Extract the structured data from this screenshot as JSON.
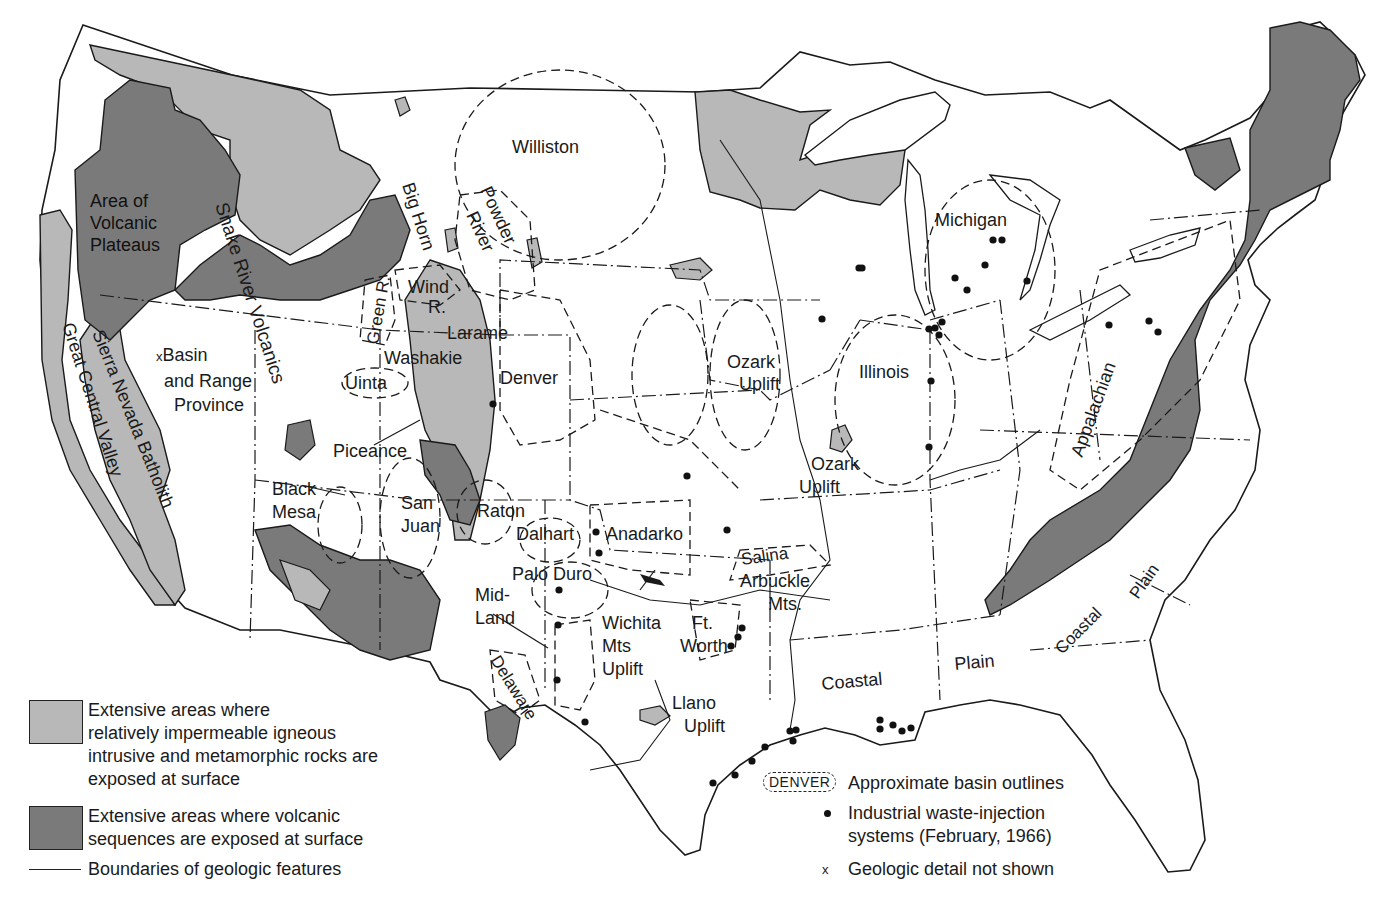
{
  "map": {
    "title": "Geologic basins and industrial waste-injection systems of the conterminous United States",
    "colors": {
      "igneous_metamorphic": "#b8b8b8",
      "volcanic": "#7a7a7a",
      "land": "#ffffff",
      "line": "#1a1a1a"
    },
    "region_labels": [
      {
        "id": "volcanic-plateaus",
        "lines": [
          "Area of",
          "Volcanic",
          "Plateaus"
        ]
      },
      {
        "id": "snake-river",
        "text": "Snake River Volcanics"
      },
      {
        "id": "basin-range",
        "marker": "x",
        "lines": [
          "Basin",
          "and Range",
          "Province"
        ]
      },
      {
        "id": "great-central-valley",
        "text": "Great Central Valley"
      },
      {
        "id": "sierra-nevada",
        "text": "Sierra Nevada Batholith"
      },
      {
        "id": "williston",
        "text": "Williston"
      },
      {
        "id": "big-horn",
        "text": "Big Horn"
      },
      {
        "id": "powder-river",
        "lines": [
          "Powder",
          "River"
        ]
      },
      {
        "id": "wind-river",
        "lines": [
          "Wind",
          "R."
        ]
      },
      {
        "id": "green-river",
        "text": "Green R."
      },
      {
        "id": "laramie",
        "text": "Larame"
      },
      {
        "id": "washakie",
        "text": "Washakie"
      },
      {
        "id": "uinta",
        "text": "Uinta"
      },
      {
        "id": "denver",
        "text": "Denver"
      },
      {
        "id": "piceance",
        "text": "Piceance"
      },
      {
        "id": "black-mesa",
        "lines": [
          "Black",
          "Mesa"
        ]
      },
      {
        "id": "san-juan",
        "lines": [
          "San",
          "Juan"
        ]
      },
      {
        "id": "raton",
        "text": "Raton"
      },
      {
        "id": "dalhart",
        "text": "Dalhart"
      },
      {
        "id": "anadarko",
        "text": "Anadarko"
      },
      {
        "id": "palo-duro",
        "text": "Palo Duro"
      },
      {
        "id": "midland",
        "lines": [
          "Mid-",
          "Land"
        ]
      },
      {
        "id": "delaware",
        "text": "Delaware"
      },
      {
        "id": "wichita",
        "lines": [
          "Wichita",
          "Mts",
          "Uplift"
        ]
      },
      {
        "id": "ft-worth",
        "lines": [
          "Ft.",
          "Worth"
        ]
      },
      {
        "id": "llano",
        "lines": [
          "Llano",
          "Uplift"
        ]
      },
      {
        "id": "arkoma",
        "text": "Arkoma"
      },
      {
        "id": "arbuckle",
        "lines": [
          "Arbuckle",
          "Mts."
        ]
      },
      {
        "id": "salina",
        "text": "Salina"
      },
      {
        "id": "forest-city",
        "lines": [
          "Forest",
          "City"
        ]
      },
      {
        "id": "ozark",
        "lines": [
          "Ozark",
          "Uplift"
        ]
      },
      {
        "id": "illinois",
        "text": "Illinois"
      },
      {
        "id": "michigan",
        "text": "Michigan"
      },
      {
        "id": "appalachian",
        "text": "Appalachian"
      },
      {
        "id": "coastal-plain-gulf-1",
        "text": "Coastal"
      },
      {
        "id": "coastal-plain-gulf-2",
        "text": "Plain"
      },
      {
        "id": "coastal-plain-atl-1",
        "text": "Coastal"
      },
      {
        "id": "coastal-plain-atl-2",
        "text": "Plain"
      }
    ]
  },
  "legend_left": {
    "items": [
      {
        "swatch": "light",
        "lines": [
          "Extensive areas where",
          "relatively impermeable igneous",
          "intrusive and metamorphic rocks are",
          "exposed at surface"
        ]
      },
      {
        "swatch": "dark",
        "lines": [
          "Extensive areas where volcanic",
          "sequences are exposed at surface"
        ]
      },
      {
        "swatch": "line",
        "lines": [
          "Boundaries of geologic features"
        ]
      }
    ]
  },
  "legend_right": {
    "items": [
      {
        "symbol": "DENVER",
        "lines": [
          "Approximate basin outlines"
        ]
      },
      {
        "symbol": "dot",
        "lines": [
          "Industrial waste-injection",
          "systems (February, 1966)"
        ]
      },
      {
        "symbol": "x",
        "lines": [
          "Geologic detail not shown"
        ]
      }
    ]
  },
  "injection_sites": [
    [
      493,
      404
    ],
    [
      596,
      532
    ],
    [
      599,
      553
    ],
    [
      559,
      590
    ],
    [
      558,
      625
    ],
    [
      557,
      680
    ],
    [
      585,
      722
    ],
    [
      687,
      476
    ],
    [
      727,
      530
    ],
    [
      742,
      628
    ],
    [
      738,
      637
    ],
    [
      731,
      646
    ],
    [
      822,
      319
    ],
    [
      859,
      268
    ],
    [
      935,
      328
    ],
    [
      942,
      322
    ],
    [
      929,
      329
    ],
    [
      939,
      335
    ],
    [
      931,
      381
    ],
    [
      929,
      447
    ],
    [
      955,
      278
    ],
    [
      985,
      265
    ],
    [
      993,
      240
    ],
    [
      1002,
      240
    ],
    [
      967,
      290
    ],
    [
      1027,
      281
    ],
    [
      1109,
      325
    ],
    [
      1149,
      321
    ],
    [
      1158,
      332
    ],
    [
      862,
      268
    ],
    [
      790,
      731
    ],
    [
      796,
      730
    ],
    [
      793,
      741
    ],
    [
      765,
      747
    ],
    [
      752,
      761
    ],
    [
      735,
      775
    ],
    [
      713,
      783
    ],
    [
      880,
      720
    ],
    [
      880,
      729
    ],
    [
      893,
      725
    ],
    [
      902,
      731
    ],
    [
      911,
      728
    ],
    [
      840,
      890
    ]
  ]
}
